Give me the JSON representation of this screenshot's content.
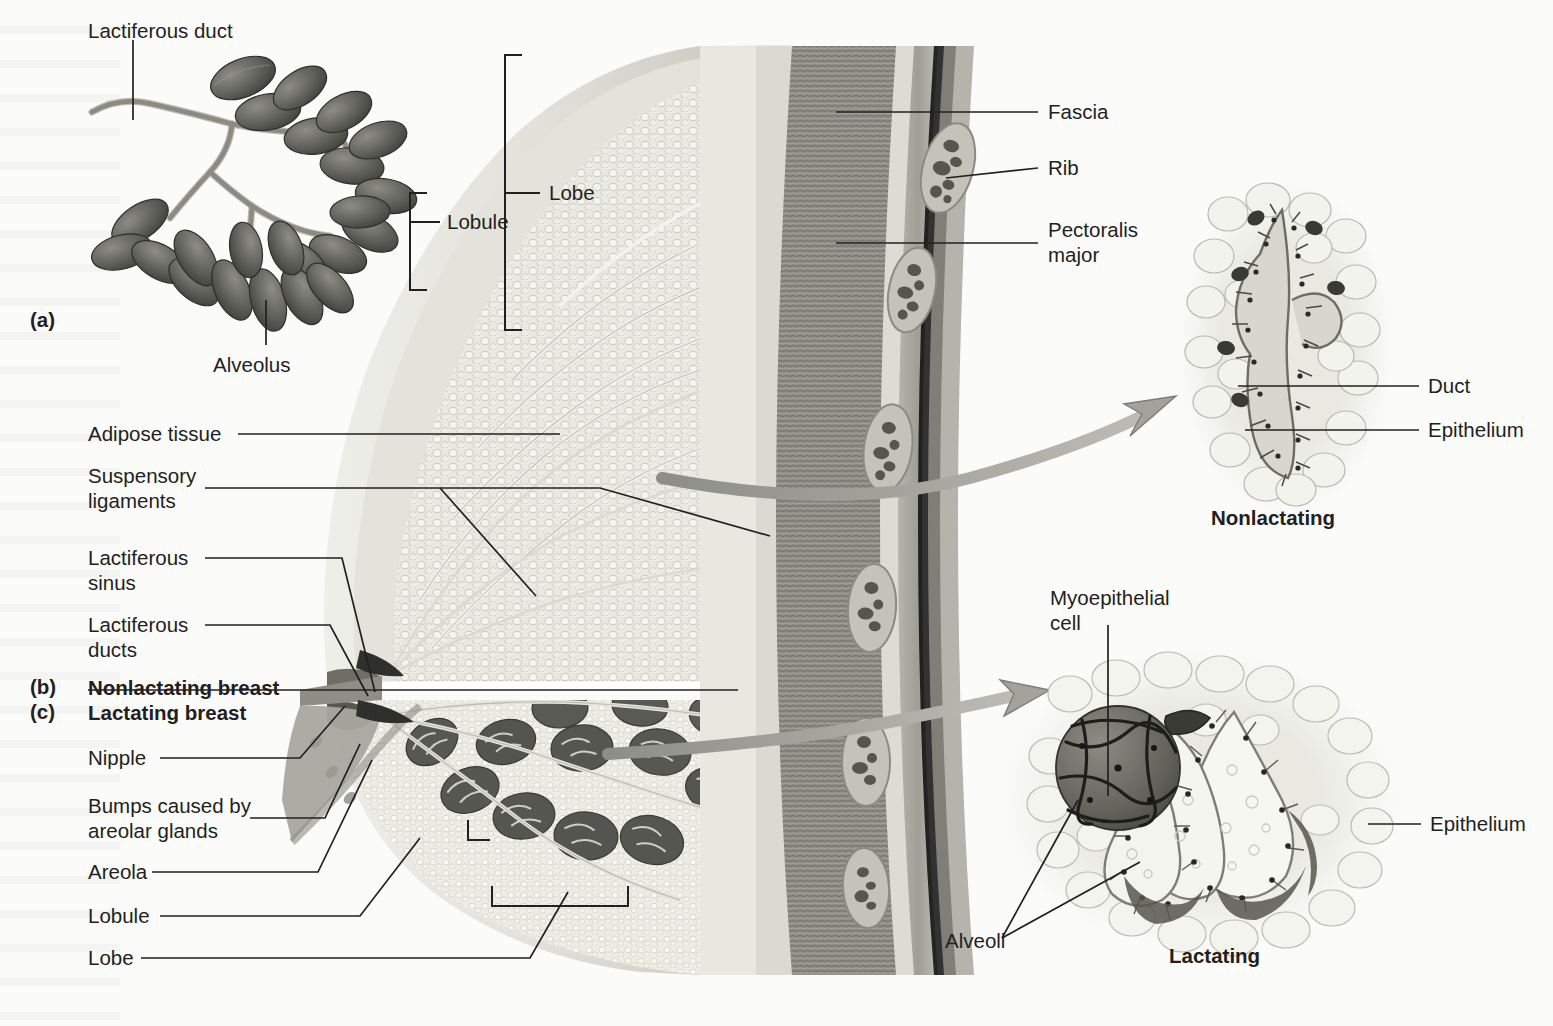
{
  "figure": {
    "background_color": "#fbfbfa",
    "line_color": "#231f20"
  },
  "panels": [
    {
      "id": "a",
      "label": "(a)"
    },
    {
      "id": "b",
      "label": "(b)"
    },
    {
      "id": "c",
      "label": "(c)"
    }
  ],
  "panel_a": {
    "labels": [
      {
        "name": "lactiferous-duct",
        "text": "Lactiferous duct"
      },
      {
        "name": "alveolus",
        "text": "Alveolus"
      },
      {
        "name": "lobule",
        "text": "Lobule"
      },
      {
        "name": "lobe",
        "text": "Lobe"
      }
    ]
  },
  "panel_bc": {
    "section_titles": [
      {
        "name": "nonlactating-breast",
        "text": "Nonlactating breast"
      },
      {
        "name": "lactating-breast",
        "text": "Lactating breast"
      }
    ],
    "left_labels": [
      {
        "name": "adipose-tissue",
        "text": "Adipose tissue"
      },
      {
        "name": "suspensory-ligaments",
        "text": "Suspensory\nligaments"
      },
      {
        "name": "lactiferous-sinus",
        "text": "Lactiferous\nsinus"
      },
      {
        "name": "lactiferous-ducts",
        "text": "Lactiferous\nducts"
      },
      {
        "name": "nipple",
        "text": "Nipple"
      },
      {
        "name": "bumps-areolar-glands",
        "text": "Bumps caused by\nareolar glands"
      },
      {
        "name": "areola",
        "text": "Areola"
      },
      {
        "name": "lobule",
        "text": "Lobule"
      },
      {
        "name": "lobe",
        "text": "Lobe"
      }
    ],
    "right_labels": [
      {
        "name": "fascia",
        "text": "Fascia"
      },
      {
        "name": "rib",
        "text": "Rib"
      },
      {
        "name": "pectoralis-major",
        "text": "Pectoralis\nmajor"
      }
    ]
  },
  "inset_nonlactating": {
    "caption": "Nonlactating",
    "labels": [
      {
        "name": "duct",
        "text": "Duct"
      },
      {
        "name": "epithelium",
        "text": "Epithelium"
      }
    ]
  },
  "inset_lactating": {
    "caption": "Lactating",
    "labels": [
      {
        "name": "myoepithelial-cell",
        "text": "Myoepithelial\ncell"
      },
      {
        "name": "alveoli",
        "text": "Alveoli"
      },
      {
        "name": "epithelium",
        "text": "Epithelium"
      }
    ]
  }
}
